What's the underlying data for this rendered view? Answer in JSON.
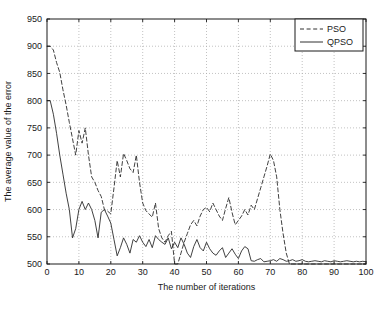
{
  "chart_data": {
    "type": "line",
    "title": "",
    "xlabel": "The number of iterations",
    "ylabel": "The average value of the error",
    "xlim": [
      0,
      100
    ],
    "ylim": [
      500,
      950
    ],
    "xticks": [
      0,
      10,
      20,
      30,
      40,
      50,
      60,
      70,
      80,
      90,
      100
    ],
    "yticks": [
      500,
      550,
      600,
      650,
      700,
      750,
      800,
      850,
      900,
      950
    ],
    "grid": true,
    "grid_style": "dotted",
    "legend_position": "top-right",
    "background_color": "#ffffff",
    "axis_color": "#1a1a1a",
    "grid_color": "#a8a8a8",
    "series": [
      {
        "name": "PSO",
        "style": "dashed",
        "color": "#2b2b2b",
        "x": [
          0,
          1,
          2,
          3,
          4,
          5,
          6,
          7,
          8,
          9,
          10,
          11,
          12,
          13,
          14,
          15,
          16,
          17,
          18,
          19,
          20,
          21,
          22,
          23,
          24,
          25,
          26,
          27,
          28,
          29,
          30,
          31,
          32,
          33,
          34,
          35,
          36,
          37,
          38,
          39,
          40,
          41,
          42,
          43,
          44,
          45,
          46,
          47,
          48,
          49,
          50,
          51,
          52,
          53,
          54,
          55,
          56,
          57,
          58,
          59,
          60,
          61,
          62,
          63,
          64,
          65,
          66,
          67,
          68,
          69,
          70,
          71,
          72,
          73,
          74,
          75,
          76,
          77,
          78,
          79,
          80,
          81,
          82,
          83,
          84,
          85,
          86,
          87,
          88,
          89,
          90,
          91,
          92,
          93,
          94,
          95,
          96,
          97,
          98,
          99,
          100
        ],
        "values": [
          900,
          900,
          893,
          870,
          852,
          820,
          792,
          760,
          730,
          700,
          745,
          722,
          750,
          700,
          660,
          650,
          635,
          624,
          600,
          597,
          592,
          640,
          690,
          660,
          703,
          690,
          675,
          668,
          700,
          650,
          612,
          598,
          592,
          586,
          612,
          565,
          548,
          540,
          552,
          560,
          500,
          500,
          520,
          540,
          556,
          572,
          580,
          570,
          588,
          600,
          604,
          596,
          612,
          600,
          588,
          580,
          602,
          622,
          595,
          572,
          580,
          588,
          600,
          590,
          608,
          600,
          620,
          640,
          660,
          680,
          702,
          690,
          660,
          600,
          556,
          520,
          500,
          500,
          500,
          500,
          500,
          500,
          500,
          500,
          500,
          500,
          500,
          500,
          500,
          500,
          500,
          500,
          500,
          500,
          500,
          500,
          500,
          500,
          500,
          500,
          500
        ]
      },
      {
        "name": "QPSO",
        "style": "solid",
        "color": "#2b2b2b",
        "x": [
          0,
          1,
          2,
          3,
          4,
          5,
          6,
          7,
          8,
          9,
          10,
          11,
          12,
          13,
          14,
          15,
          16,
          17,
          18,
          19,
          20,
          21,
          22,
          23,
          24,
          25,
          26,
          27,
          28,
          29,
          30,
          31,
          32,
          33,
          34,
          35,
          36,
          37,
          38,
          39,
          40,
          41,
          42,
          43,
          44,
          45,
          46,
          47,
          48,
          49,
          50,
          51,
          52,
          53,
          54,
          55,
          56,
          57,
          58,
          59,
          60,
          61,
          62,
          63,
          64,
          65,
          66,
          67,
          68,
          69,
          70,
          71,
          72,
          73,
          74,
          75,
          76,
          77,
          78,
          79,
          80,
          81,
          82,
          83,
          84,
          85,
          86,
          87,
          88,
          89,
          90,
          91,
          92,
          93,
          94,
          95,
          96,
          97,
          98,
          99,
          100
        ],
        "values": [
          800,
          800,
          775,
          740,
          700,
          665,
          630,
          600,
          548,
          565,
          600,
          615,
          600,
          612,
          600,
          580,
          548,
          595,
          600,
          588,
          575,
          545,
          515,
          530,
          548,
          536,
          520,
          545,
          540,
          552,
          540,
          532,
          545,
          530,
          552,
          545,
          540,
          536,
          548,
          528,
          540,
          530,
          548,
          536,
          520,
          512,
          532,
          545,
          530,
          524,
          540,
          528,
          520,
          516,
          524,
          530,
          512,
          520,
          528,
          518,
          510,
          524,
          532,
          528,
          506,
          505,
          508,
          510,
          504,
          505,
          506,
          508,
          505,
          510,
          508,
          505,
          506,
          508,
          505,
          506,
          508,
          505,
          504,
          505,
          506,
          505,
          504,
          506,
          505,
          504,
          506,
          505,
          504,
          505,
          506,
          505,
          504,
          505,
          504,
          505,
          504
        ]
      }
    ]
  },
  "legend": {
    "entries": [
      {
        "label": "PSO",
        "style": "dashed"
      },
      {
        "label": "QPSO",
        "style": "solid"
      }
    ]
  },
  "axes": {
    "x_label": "The number of iterations",
    "y_label": "The average value of the error",
    "x_ticks": [
      "0",
      "10",
      "20",
      "30",
      "40",
      "50",
      "60",
      "70",
      "80",
      "90",
      "100"
    ],
    "y_ticks": [
      "500",
      "550",
      "600",
      "650",
      "700",
      "750",
      "800",
      "850",
      "900",
      "950"
    ]
  }
}
